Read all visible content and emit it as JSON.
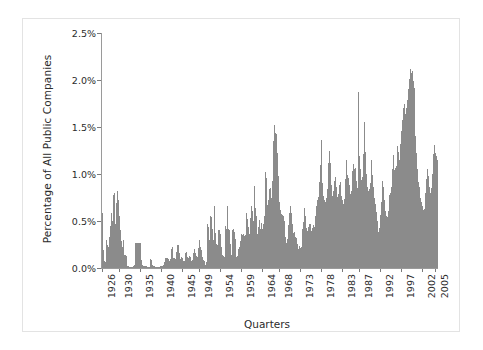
{
  "chart_data": {
    "type": "bar",
    "title": "",
    "xlabel": "Quarters",
    "ylabel": "Percentage of All Public Companies",
    "ylim": [
      0,
      2.5
    ],
    "ytick_labels": [
      "0.0%",
      "0.5%",
      "1.0%",
      "1.5%",
      "2.0%",
      "2.5%"
    ],
    "ytick_values": [
      0,
      0.5,
      1.0,
      1.5,
      2.0,
      2.5
    ],
    "xtick_labels": [
      "1926",
      "1930",
      "1935",
      "1940",
      "1945",
      "1949",
      "1954",
      "1959",
      "1964",
      "1968",
      "1973",
      "1978",
      "1983",
      "1987",
      "1992",
      "1997",
      "2002",
      "2005"
    ],
    "xtick_years": [
      1926,
      1930,
      1935,
      1940,
      1945,
      1949,
      1954,
      1959,
      1964,
      1968,
      1973,
      1978,
      1983,
      1987,
      1992,
      1997,
      2002,
      2005
    ],
    "x_start_year": 1926,
    "x_end_year": 2005.75,
    "grid": false,
    "legend": null,
    "bar_color": "#8b8b8b",
    "axis_color": "#9a9a9a",
    "units": "percent",
    "x_unit": "quarter",
    "series": [
      {
        "name": "Percentage of All Public Companies",
        "values": [
          0.59,
          0.19,
          0.07,
          0.06,
          0.3,
          0.26,
          0.25,
          0.22,
          0.33,
          0.45,
          0.58,
          0.5,
          0.78,
          0.8,
          0.47,
          0.26,
          0.69,
          0.82,
          0.72,
          0.55,
          0.4,
          0.29,
          0.22,
          0.3,
          0.14,
          0.14,
          0.13,
          0.13,
          0.02,
          0.02,
          0.01,
          0.01,
          0.01,
          0.01,
          0.02,
          0.02,
          0.03,
          0.27,
          0.27,
          0.27,
          0.27,
          0.27,
          0.27,
          0.09,
          0.03,
          0.02,
          0.02,
          0.02,
          0.02,
          0.02,
          0.01,
          0.01,
          0.01,
          0.1,
          0.09,
          0.03,
          0.02,
          0.02,
          0.02,
          0.01,
          0.01,
          0.01,
          0.01,
          0.01,
          0.02,
          0.02,
          0.02,
          0.02,
          0.03,
          0.06,
          0.11,
          0.11,
          0.11,
          0.1,
          0.07,
          0.1,
          0.2,
          0.22,
          0.16,
          0.11,
          0.11,
          0.1,
          0.17,
          0.24,
          0.25,
          0.16,
          0.1,
          0.11,
          0.12,
          0.11,
          0.07,
          0.07,
          0.16,
          0.17,
          0.12,
          0.11,
          0.13,
          0.12,
          0.07,
          0.07,
          0.08,
          0.16,
          0.2,
          0.16,
          0.13,
          0.12,
          0.21,
          0.3,
          0.22,
          0.2,
          0.19,
          0.12,
          0.08,
          0.07,
          0.03,
          0.06,
          0.47,
          0.44,
          0.3,
          0.25,
          0.55,
          0.54,
          0.41,
          0.3,
          0.66,
          0.37,
          0.26,
          0.24,
          0.26,
          0.4,
          0.4,
          0.36,
          0.22,
          0.14,
          0.13,
          0.12,
          0.45,
          0.42,
          0.66,
          0.42,
          0.41,
          0.4,
          0.26,
          0.14,
          0.4,
          0.41,
          0.38,
          0.31,
          0.12,
          0.11,
          0.13,
          0.2,
          0.22,
          0.29,
          0.36,
          0.35,
          0.36,
          0.34,
          0.35,
          0.42,
          0.59,
          0.52,
          0.44,
          0.36,
          0.53,
          0.66,
          0.61,
          0.5,
          0.87,
          0.64,
          0.55,
          0.36,
          0.36,
          0.44,
          0.51,
          0.41,
          0.48,
          0.42,
          0.47,
          0.55,
          0.7,
          1.02,
          0.96,
          0.67,
          0.72,
          0.84,
          0.85,
          0.75,
          0.93,
          1.35,
          1.52,
          1.43,
          1.44,
          1.43,
          1.22,
          0.98,
          0.7,
          0.62,
          0.57,
          0.56,
          0.55,
          0.5,
          0.42,
          0.33,
          0.27,
          0.31,
          0.46,
          0.58,
          0.66,
          0.58,
          0.47,
          0.35,
          0.37,
          0.38,
          0.33,
          0.32,
          0.26,
          0.2,
          0.23,
          0.21,
          0.22,
          0.33,
          0.41,
          0.49,
          0.64,
          0.55,
          0.43,
          0.39,
          0.44,
          0.47,
          0.47,
          0.39,
          0.4,
          0.43,
          0.46,
          0.44,
          0.55,
          0.66,
          0.72,
          0.76,
          0.92,
          1.1,
          1.36,
          1.06,
          0.9,
          0.77,
          0.72,
          0.7,
          0.74,
          0.84,
          1.12,
          1.25,
          1.12,
          0.95,
          0.88,
          0.77,
          0.82,
          0.93,
          0.97,
          0.86,
          0.76,
          0.79,
          0.88,
          0.92,
          0.74,
          0.77,
          0.72,
          0.68,
          0.73,
          0.95,
          1.15,
          0.99,
          0.96,
          0.88,
          0.84,
          0.79,
          0.82,
          1.03,
          1.11,
          1.05,
          1.06,
          0.93,
          0.85,
          0.86,
          1.87,
          1.19,
          1.05,
          0.94,
          0.97,
          1.21,
          1.55,
          1.23,
          1.0,
          0.86,
          0.82,
          0.76,
          0.84,
          0.9,
          1.15,
          0.99,
          0.86,
          0.75,
          0.68,
          0.6,
          0.5,
          0.41,
          0.38,
          0.43,
          0.56,
          0.7,
          0.93,
          0.86,
          0.72,
          0.61,
          0.55,
          0.52,
          0.54,
          0.61,
          0.78,
          0.8,
          0.86,
          1.05,
          1.2,
          1.04,
          1.06,
          1.01,
          1.09,
          1.3,
          1.23,
          1.15,
          1.32,
          1.46,
          1.57,
          1.7,
          1.74,
          1.64,
          1.62,
          1.7,
          1.79,
          1.9,
          2.01,
          2.12,
          2.07,
          2.1,
          1.99,
          1.92,
          1.64,
          1.4,
          1.22,
          1.05,
          0.92,
          0.86,
          0.75,
          0.7,
          0.66,
          0.62,
          0.58,
          0.63,
          0.8,
          0.95,
          1.05,
          0.98,
          0.86,
          0.8,
          0.85,
          1.0,
          1.14,
          1.21,
          1.31,
          1.22,
          1.19,
          1.15
        ]
      }
    ]
  },
  "figure": {
    "background_color": "#ffffff",
    "border_color": "#e3e3e3"
  }
}
